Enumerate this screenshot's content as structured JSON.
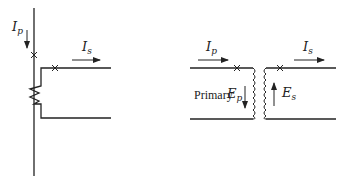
{
  "diagram": {
    "left_circuit": {
      "primary_current": {
        "symbol": "I",
        "subscript": "p"
      },
      "secondary_current": {
        "symbol": "I",
        "subscript": "s"
      }
    },
    "right_circuit": {
      "primary_current": {
        "symbol": "I",
        "subscript": "p"
      },
      "secondary_current": {
        "symbol": "I",
        "subscript": "s"
      },
      "primary_label": "Primary",
      "primary_emf": {
        "symbol": "E",
        "subscript": "p"
      },
      "secondary_emf": {
        "symbol": "E",
        "subscript": "s"
      }
    },
    "colors": {
      "line": "#222222",
      "background": "#ffffff"
    }
  }
}
